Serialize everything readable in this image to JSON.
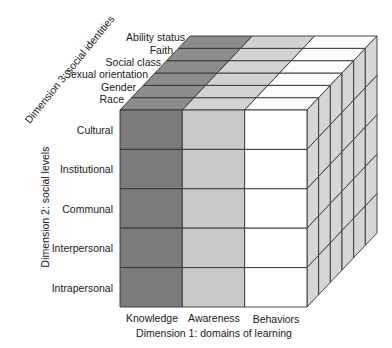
{
  "figure": {
    "dimension1": {
      "label": "Dimension 1: domains of learning",
      "columns": [
        "Knowledge",
        "Awareness",
        "Behaviors"
      ]
    },
    "dimension2": {
      "label": "Dimension 2: social levels",
      "rows": [
        "Cultural",
        "Institutional",
        "Communal",
        "Interpersonal",
        "Intrapersonal"
      ]
    },
    "dimension3": {
      "label": "Dimension 3: social identities",
      "layers": [
        "Race",
        "Gender",
        "Sexual orientation",
        "Social class",
        "Faith",
        "Ability status"
      ]
    },
    "colors": {
      "knowledge_front": "#7b7b7b",
      "knowledge_top": "#8c8c8c",
      "awareness_front": "#c9c9c9",
      "awareness_top": "#d2d2d2",
      "behaviors_front": "#ffffff",
      "behaviors_top": "#fbfbfb",
      "right_side": "#d6d6d6",
      "lines": "#333333"
    }
  }
}
